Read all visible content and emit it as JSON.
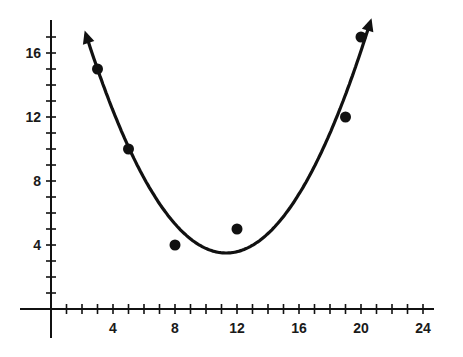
{
  "chart_data": {
    "type": "scatter",
    "title": "",
    "xlabel": "",
    "ylabel": "",
    "xlim": [
      -2,
      25
    ],
    "ylim": [
      -2,
      18
    ],
    "grid": false,
    "legend": null,
    "x_ticks": [
      4,
      8,
      12,
      16,
      20,
      24
    ],
    "x_minor_step": 1,
    "y_ticks": [
      4,
      8,
      12,
      16
    ],
    "y_minor_step": 1,
    "points": [
      {
        "x": 3,
        "y": 15
      },
      {
        "x": 5,
        "y": 10
      },
      {
        "x": 8,
        "y": 4
      },
      {
        "x": 12,
        "y": 5
      },
      {
        "x": 19,
        "y": 12
      },
      {
        "x": 20,
        "y": 17
      }
    ],
    "fit_curve": {
      "type": "quadratic",
      "description": "Parabola of best fit opening upward with arrowheads at both ends",
      "vertex": {
        "x": 11.3,
        "y": 3.5
      },
      "arrows": "both-ends"
    },
    "colors": {
      "ink": "#111111",
      "background": "#ffffff"
    }
  }
}
